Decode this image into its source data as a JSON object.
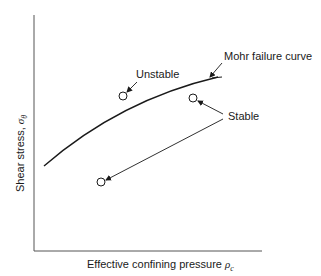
{
  "diagram": {
    "title": "",
    "axes": {
      "y_label": "Shear stress, ",
      "y_symbol": "σ",
      "y_subscript": "θ",
      "x_label": "Effective confining pressure ",
      "x_symbol": "ρ",
      "x_subscript": "c"
    },
    "labels": {
      "unstable": "Unstable",
      "stable": "Stable",
      "curve": "Mohr failure curve"
    },
    "points": [
      {
        "name": "unstable-point",
        "state": "Unstable",
        "x": 123,
        "y": 96
      },
      {
        "name": "stable-point-upper",
        "state": "Stable",
        "x": 193,
        "y": 98
      },
      {
        "name": "stable-point-lower",
        "state": "Stable",
        "x": 101,
        "y": 182
      }
    ],
    "colors": {
      "line": "#1a1a1a",
      "axis": "#555555",
      "background": "#ffffff"
    }
  }
}
